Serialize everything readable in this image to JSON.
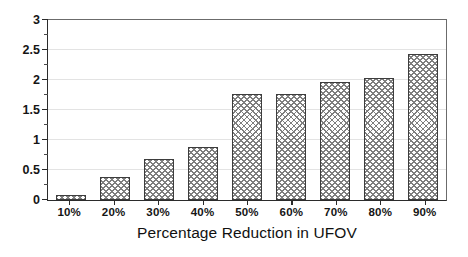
{
  "chart_data": {
    "type": "bar",
    "title": "",
    "xlabel": "Percentage Reduction in UFOV",
    "ylabel": "",
    "categories": [
      "10%",
      "20%",
      "30%",
      "40%",
      "50%",
      "60%",
      "70%",
      "80%",
      "90%"
    ],
    "values": [
      0.09,
      0.39,
      0.68,
      0.88,
      1.77,
      1.76,
      1.96,
      2.04,
      2.44
    ],
    "ylim": [
      0,
      3
    ],
    "ytick_labels": [
      "0",
      "0.5",
      "1",
      "1.5",
      "2",
      "2.5",
      "3"
    ],
    "ytick_values": [
      0,
      0.5,
      1,
      1.5,
      2,
      2.5,
      3
    ],
    "yminor_tick_values": [
      0.25,
      0.75,
      1.25,
      1.75,
      2.25,
      2.75
    ],
    "grid": true,
    "legend": null,
    "bar_fill": "crosshatch",
    "colors": {
      "bar_edge": "#3d3d3d",
      "bar_hatch": "#7e7e7e",
      "axis": "#2b2b2b",
      "grid": "#e3e3e3",
      "background": "#ffffff",
      "text": "#151515"
    }
  }
}
